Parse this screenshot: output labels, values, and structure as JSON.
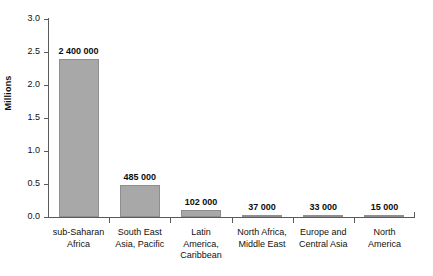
{
  "chart_data": {
    "type": "bar",
    "title": "",
    "xlabel": "",
    "ylabel": "Millions",
    "ylim": [
      0,
      3.0
    ],
    "ytick_step": 0.5,
    "grid": false,
    "legend": null,
    "bar_color": "#a8a8a8",
    "bar_edge_color": "#8e8e8e",
    "unit_scale": "millions",
    "categories": [
      "sub-Saharan Africa",
      "South East Asia, Pacific",
      "Latin America, Caribbean",
      "North Africa, Middle East",
      "Europe and Central Asia",
      "North America"
    ],
    "category_label_lines": [
      [
        "sub-Saharan",
        "Africa"
      ],
      [
        "South East",
        "Asia, Pacific"
      ],
      [
        "Latin",
        "America,",
        "Caribbean"
      ],
      [
        "North Africa,",
        "Middle East"
      ],
      [
        "Europe and",
        "Central Asia"
      ],
      [
        "North",
        "America"
      ]
    ],
    "values": [
      2.4,
      0.485,
      0.102,
      0.037,
      0.033,
      0.015
    ],
    "data_labels": [
      "2 400 000",
      "485 000",
      "102 000",
      "37 000",
      "33 000",
      "15 000"
    ],
    "ytick_labels": [
      "0.0",
      "0.5",
      "1.0",
      "1.5",
      "2.0",
      "2.5",
      "3.0"
    ],
    "ytick_values": [
      0.0,
      0.5,
      1.0,
      1.5,
      2.0,
      2.5,
      3.0
    ]
  }
}
